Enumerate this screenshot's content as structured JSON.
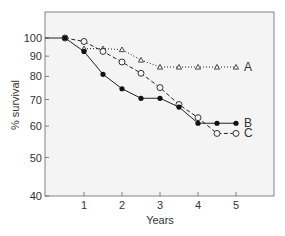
{
  "chart_data": {
    "type": "line",
    "title": "",
    "xlabel": "Years",
    "ylabel": "% survival",
    "yscale": "log",
    "xlim": [
      0,
      6
    ],
    "ylim": [
      40,
      100
    ],
    "x_ticks": [
      1,
      2,
      3,
      4,
      5
    ],
    "x_tick_labels": [
      "1",
      "2",
      "3",
      "4",
      "5"
    ],
    "y_ticks": [
      40,
      50,
      60,
      70,
      80,
      90,
      100
    ],
    "y_tick_labels": [
      "40",
      "50",
      "60",
      "70",
      "80",
      "90",
      "100"
    ],
    "grid": false,
    "legend": "direct labels at right end of each line",
    "baseline": {
      "x": [
        0,
        0.5
      ],
      "y": [
        100,
        100
      ]
    },
    "series": [
      {
        "name": "A",
        "marker": "open-triangle",
        "line": "dotted",
        "x": [
          1,
          1.5,
          2,
          2.5,
          3,
          3.5,
          4,
          4.5,
          5
        ],
        "y": [
          94,
          94,
          93.5,
          88,
          84.5,
          84.5,
          84.5,
          84.5,
          84.5
        ]
      },
      {
        "name": "B",
        "marker": "filled-circle",
        "line": "solid",
        "x": [
          0.5,
          1,
          1.5,
          2,
          2.5,
          3,
          3.5,
          4,
          4.5,
          5
        ],
        "y": [
          100,
          92.5,
          81,
          74.5,
          70.5,
          70.5,
          67,
          61,
          61,
          61
        ]
      },
      {
        "name": "C",
        "marker": "open-circle",
        "line": "dashed",
        "x": [
          0.5,
          1,
          1.5,
          2,
          2.5,
          3,
          3.5,
          4,
          4.5,
          5
        ],
        "y": [
          100,
          98,
          92.5,
          87,
          81.5,
          75,
          68,
          63,
          57.5,
          57.5
        ]
      }
    ]
  }
}
